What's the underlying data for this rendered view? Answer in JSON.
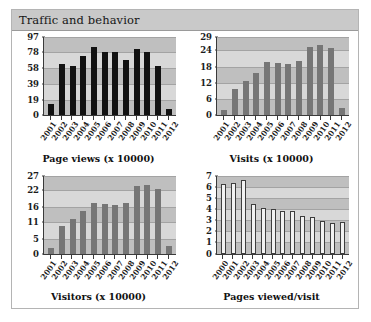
{
  "panel": {
    "title": "Traffic and behavior"
  },
  "colors": {
    "panel_header_bg": "#c9c9c9",
    "panel_border": "#b4b4b4",
    "plot_bg": "#bfbfbf",
    "plot_band": "#d8d8d8",
    "bar_black": "#121212",
    "bar_gray": "#767676",
    "bar_white": "#f2f2f2",
    "axis": "#3a3a3a",
    "text": "#161616"
  },
  "chart_data": [
    {
      "id": "page-views",
      "type": "bar",
      "title": "Page views (x 10000)",
      "xlabel": "",
      "ylabel": "",
      "bar_style": "black",
      "grid": true,
      "legend": "none",
      "ylim": [
        0,
        97
      ],
      "yticks": [
        0,
        19,
        39,
        58,
        78,
        97
      ],
      "categories": [
        "2001",
        "2002",
        "2003",
        "2004",
        "2005",
        "2006",
        "2007",
        "2008",
        "2009",
        "2010",
        "2011",
        "2012"
      ],
      "values": [
        14,
        63,
        61,
        73,
        85,
        78,
        78,
        68,
        82,
        78,
        61,
        7
      ]
    },
    {
      "id": "visits",
      "type": "bar",
      "title": "Visits (x 10000)",
      "xlabel": "",
      "ylabel": "",
      "bar_style": "gray",
      "grid": true,
      "legend": "none",
      "ylim": [
        0,
        29
      ],
      "yticks": [
        0,
        6,
        12,
        18,
        24,
        29
      ],
      "categories": [
        "2001",
        "2002",
        "2003",
        "2004",
        "2005",
        "2006",
        "2007",
        "2008",
        "2009",
        "2010",
        "2011",
        "2012"
      ],
      "values": [
        1.8,
        9.5,
        12.6,
        15.5,
        19.8,
        19.2,
        19.0,
        20.0,
        25.3,
        26.0,
        24.8,
        2.7
      ]
    },
    {
      "id": "visitors",
      "type": "bar",
      "title": "Visitors (x 10000)",
      "xlabel": "",
      "ylabel": "",
      "bar_style": "gray",
      "grid": true,
      "legend": "none",
      "ylim": [
        0,
        27
      ],
      "yticks": [
        0,
        5,
        11,
        16,
        22,
        27
      ],
      "categories": [
        "2001",
        "2002",
        "2003",
        "2004",
        "2005",
        "2006",
        "2007",
        "2008",
        "2009",
        "2010",
        "2011",
        "2012"
      ],
      "values": [
        2.0,
        9.5,
        12.0,
        14.8,
        17.6,
        17.0,
        16.7,
        17.5,
        23.2,
        23.8,
        22.5,
        2.6
      ]
    },
    {
      "id": "pages-viewed-per-visit",
      "type": "bar",
      "title": "Pages viewed/visit",
      "xlabel": "",
      "ylabel": "",
      "bar_style": "white",
      "grid": true,
      "legend": "none",
      "ylim": [
        0,
        7
      ],
      "yticks": [
        0,
        1,
        2,
        3,
        4,
        5,
        6,
        7
      ],
      "categories": [
        "2000",
        "2001",
        "2002",
        "2003",
        "2004",
        "2005",
        "2006",
        "2007",
        "2008",
        "2009",
        "2010",
        "2011",
        "2012"
      ],
      "values": [
        6.2,
        6.3,
        6.6,
        4.4,
        4.1,
        4.0,
        3.85,
        3.8,
        3.35,
        3.25,
        2.95,
        2.7,
        2.8
      ]
    }
  ]
}
